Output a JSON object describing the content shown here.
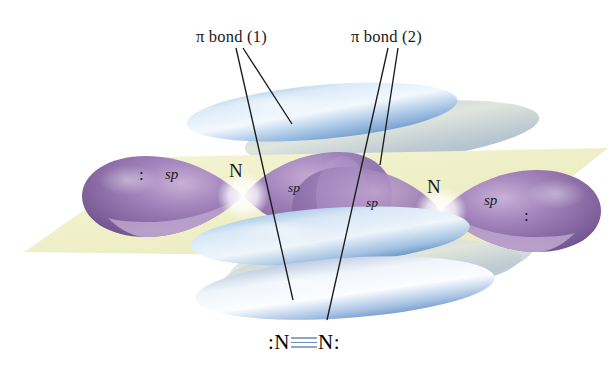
{
  "figure": {
    "background_color": "#ffffff"
  },
  "labels": {
    "pi_bond_1": "π bond (1)",
    "pi_bond_2": "π bond (2)",
    "atom_left": "N",
    "atom_right": "N",
    "sp_outer_left": "sp",
    "sp_inner_left": "sp",
    "sp_inner_right": "sp",
    "sp_outer_right": "sp",
    "lone_pair_left": ":",
    "lone_pair_right": ":"
  },
  "lewis_structure": {
    "left_lone_pair": ":",
    "left_atom": "N",
    "bond": "triple-bond",
    "right_atom": "N",
    "right_lone_pair": ":"
  },
  "colors": {
    "plane": "#f2f2cf",
    "sp_lobe_purple": "#8d6ea6",
    "sp_lobe_purple_light": "#c3a9d2",
    "pi_lobe_blue": "#7ea9d8",
    "pi_lobe_blue_light": "#dfeaf7",
    "pi_lobe_back": "#c8d2cc",
    "leader_line": "#1a1a1a",
    "text": "#1a1a1a",
    "lewis_bond": "#8fa7c4"
  }
}
